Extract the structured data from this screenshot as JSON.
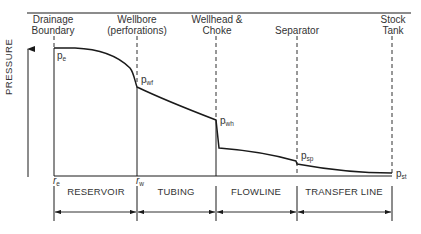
{
  "header": {
    "stations": [
      {
        "id": "drainage",
        "line1": "Drainage",
        "line2": "Boundary"
      },
      {
        "id": "wellbore",
        "line1": "Wellbore",
        "line2": "(perforations)"
      },
      {
        "id": "wellhead",
        "line1": "Wellhead &",
        "line2": "Choke"
      },
      {
        "id": "separator",
        "line1": "",
        "line2": "Separator"
      },
      {
        "id": "stock",
        "line1": "Stock",
        "line2": "Tank"
      }
    ]
  },
  "axis": {
    "y_label": "PRESSURE"
  },
  "pressure_points": {
    "pe": {
      "base": "p",
      "sub": "e"
    },
    "pwf": {
      "base": "p",
      "sub": "wf"
    },
    "pwh": {
      "base": "p",
      "sub": "wh"
    },
    "psp": {
      "base": "p",
      "sub": "sp"
    },
    "pst": {
      "base": "p",
      "sub": "st"
    }
  },
  "radius_labels": {
    "re": {
      "base": "r",
      "sub": "e"
    },
    "rw": {
      "base": "r",
      "sub": "w"
    }
  },
  "segments": [
    {
      "id": "reservoir",
      "label": "RESERVOIR"
    },
    {
      "id": "tubing",
      "label": "TUBING"
    },
    {
      "id": "flowline",
      "label": "FLOWLINE"
    },
    {
      "id": "transfer",
      "label": "TRANSFER LINE"
    }
  ],
  "colors": {
    "line": "#1a1a1a",
    "text": "#333333"
  }
}
